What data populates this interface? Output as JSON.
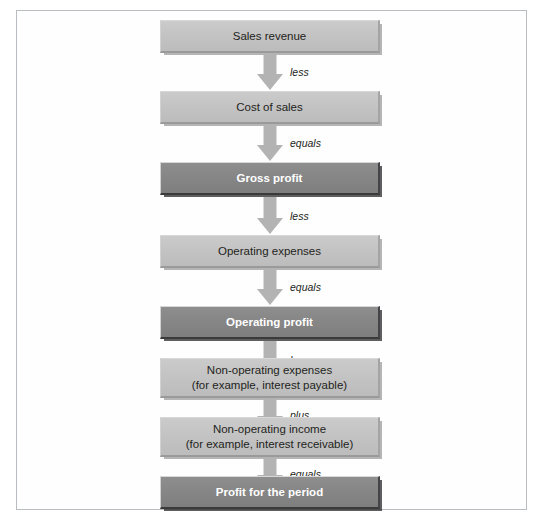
{
  "figure": {
    "type": "flowchart",
    "orientation": "vertical",
    "title": "",
    "colors": {
      "light_box_fill": "#c3c3c3",
      "dark_box_fill": "#868686",
      "light_box_text": "#231f20",
      "dark_box_text": "#ffffff",
      "arrow_fill": "#b3b3b3",
      "frame_border": "#b9bcc0",
      "background": "#ffffff"
    },
    "nodes": [
      {
        "id": "sales-revenue",
        "label": "Sales revenue",
        "line1": "Sales revenue",
        "line2": "",
        "style": "light",
        "lines": 1
      },
      {
        "id": "cost-of-sales",
        "label": "Cost of sales",
        "line1": "Cost of sales",
        "line2": "",
        "style": "light",
        "lines": 1
      },
      {
        "id": "gross-profit",
        "label": "Gross profit",
        "line1": "Gross profit",
        "line2": "",
        "style": "dark",
        "lines": 1
      },
      {
        "id": "operating-expenses",
        "label": "Operating expenses",
        "line1": "Operating expenses",
        "line2": "",
        "style": "light",
        "lines": 1
      },
      {
        "id": "operating-profit",
        "label": "Operating profit",
        "line1": "Operating profit",
        "line2": "",
        "style": "dark",
        "lines": 1
      },
      {
        "id": "non-operating-expenses",
        "label": "Non-operating expenses (for example, interest payable)",
        "line1": "Non-operating expenses",
        "line2": "(for example, interest payable)",
        "style": "light",
        "lines": 2
      },
      {
        "id": "non-operating-income",
        "label": "Non-operating income (for example, interest receivable)",
        "line1": "Non-operating income",
        "line2": "(for example, interest receivable)",
        "style": "light",
        "lines": 2
      },
      {
        "id": "profit-for-the-period",
        "label": "Profit for the period",
        "line1": "Profit for the period",
        "line2": "",
        "style": "dark",
        "lines": 1
      }
    ],
    "connectors": [
      {
        "id": "c1",
        "from": "sales-revenue",
        "to": "cost-of-sales",
        "label": "less"
      },
      {
        "id": "c2",
        "from": "cost-of-sales",
        "to": "gross-profit",
        "label": "equals"
      },
      {
        "id": "c3",
        "from": "gross-profit",
        "to": "operating-expenses",
        "label": "less"
      },
      {
        "id": "c4",
        "from": "operating-expenses",
        "to": "operating-profit",
        "label": "equals"
      },
      {
        "id": "c5",
        "from": "operating-profit",
        "to": "non-operating-expenses",
        "label": "less"
      },
      {
        "id": "c6",
        "from": "non-operating-expenses",
        "to": "non-operating-income",
        "label": "plus"
      },
      {
        "id": "c7",
        "from": "non-operating-income",
        "to": "profit-for-the-period",
        "label": "equals"
      }
    ]
  },
  "caption": {
    "text": ""
  }
}
